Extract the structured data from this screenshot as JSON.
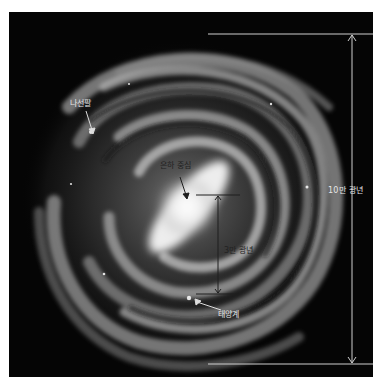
{
  "diagram": {
    "labels": {
      "spiral_arm": "나선팔",
      "galactic_center": "은하 중심",
      "diameter": "10만 광년",
      "sun_distance": "3만 광년",
      "solar_system": "태양계"
    },
    "colors": {
      "background": "#050505",
      "page": "#ffffff",
      "galaxy_glow": "#ffffff",
      "arm": "#9a9a9a",
      "annotation_light": "#e6e6e6",
      "annotation_dark": "#222222"
    }
  }
}
